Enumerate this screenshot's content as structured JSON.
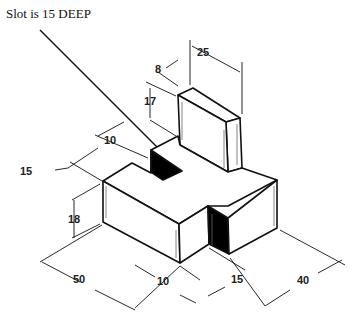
{
  "annotation": "Slot is 15 DEEP",
  "dimensions": {
    "upright_depth": "8",
    "upright_width": "25",
    "upright_height": "17",
    "slot_width": "10",
    "left_depth": "15",
    "base_height": "18",
    "base_length": "50",
    "notch_width": "10",
    "notch_depth": "15",
    "base_width": "40"
  },
  "colors": {
    "line": "#111111",
    "fill_dark": "#000000",
    "background": "#ffffff"
  }
}
